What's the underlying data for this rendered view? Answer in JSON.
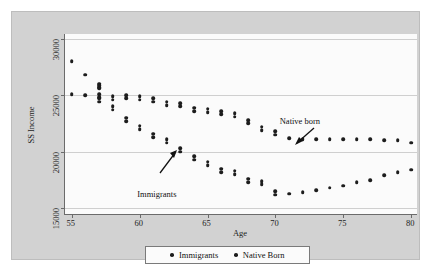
{
  "chart_data": {
    "type": "scatter",
    "title": "",
    "xlabel": "Age",
    "ylabel": "SS Income",
    "xlim": [
      54.5,
      80.5
    ],
    "ylim": [
      14400,
      30400
    ],
    "xticks": [
      55,
      60,
      65,
      70,
      75,
      80
    ],
    "yticks": [
      15000,
      20000,
      25000,
      30000
    ],
    "ytick_labels": [
      "15000",
      "20000",
      "25000",
      "30000"
    ],
    "xtick_labels": [
      "55",
      "60",
      "65",
      "70",
      "75",
      "80"
    ],
    "grid": "horizontal",
    "legend_position": "bottom",
    "x": [
      55,
      56,
      57,
      57,
      58,
      59,
      60,
      61,
      62,
      63,
      64,
      65,
      66,
      67,
      68,
      69,
      70,
      71,
      72,
      73,
      74,
      75,
      76,
      77,
      78,
      79,
      80
    ],
    "series": [
      {
        "name": "Immigrants",
        "label": "Immigrants",
        "values": [
          28000,
          26800,
          26000,
          25900,
          24000,
          23000,
          22300,
          21600,
          21100,
          20300,
          19600,
          19100,
          18500,
          18300,
          17600,
          17400,
          16500,
          16300,
          16400,
          16600,
          16800,
          17000,
          17300,
          17500,
          17900,
          18200,
          18400
        ]
      },
      {
        "name": "Native Born",
        "label": "Native Born",
        "values": [
          25100,
          25000,
          25100,
          24700,
          24900,
          25000,
          24900,
          24700,
          24400,
          24300,
          23900,
          23800,
          23600,
          23400,
          22800,
          22200,
          21800,
          21200,
          21100,
          21100,
          21100,
          21100,
          21100,
          21100,
          21000,
          21000,
          20800
        ]
      }
    ],
    "annotations": [
      {
        "text": "Native born",
        "x": 72.6,
        "y": 22600
      },
      {
        "text": "Immigrants",
        "x": 62.4,
        "y": 18500
      }
    ]
  },
  "legend": {
    "items": [
      {
        "label": "Immigrants"
      },
      {
        "label": "Native Born"
      }
    ]
  }
}
